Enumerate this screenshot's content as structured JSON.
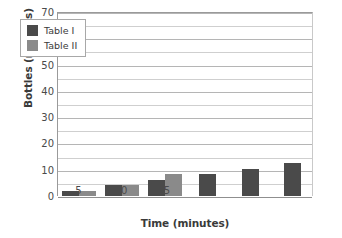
{
  "chart_data": {
    "type": "bar",
    "title": "",
    "xlabel": "Time (minutes)",
    "ylabel": "Bottles (millions)",
    "categories": [
      "5",
      "10",
      "15",
      "20",
      "25",
      "30"
    ],
    "series": [
      {
        "name": "Table I",
        "color": "#4a4a4a",
        "values": [
          2,
          4.3,
          6,
          8.3,
          10.3,
          12.5
        ]
      },
      {
        "name": "Table II",
        "color": "#8a8a8a",
        "values": [
          2,
          4.3,
          8.5,
          null,
          null,
          null
        ]
      }
    ],
    "ylim": [
      0,
      70
    ],
    "y_major_ticks": [
      0,
      10,
      20,
      30,
      40,
      50,
      60,
      70
    ],
    "y_tick_labels": [
      "0",
      "10",
      "20",
      "30",
      "40",
      "50",
      "60",
      "70"
    ],
    "y_minor_ticks": [
      5,
      15,
      25,
      35,
      45,
      55,
      65
    ],
    "grid": true,
    "legend_position": "upper-left-inside",
    "legend_entries": [
      "Table I",
      "Table II"
    ]
  },
  "colors": {
    "series_1": "#4a4a4a",
    "series_2": "#8a8a8a",
    "gridline": "#b5b5b5",
    "gridline_minor": "#cfcfcf",
    "axis": "#8f8f8f",
    "text": "#3a3a3a",
    "background": "#ffffff"
  }
}
